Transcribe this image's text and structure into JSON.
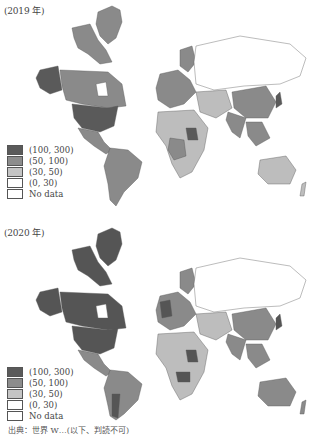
{
  "figure": {
    "panels": [
      {
        "label": "(2019 年)",
        "year": "2019",
        "region_shades": {
          "north_america_arctic": "#8a8a8a",
          "alaska": "#5a5a5a",
          "canada": "#8a8a8a",
          "usa": "#5a5a5a",
          "mexico": "#8a8a8a",
          "south_america": "#8a8a8a",
          "greenland": "#8a8a8a",
          "russia": "#ffffff",
          "europe": "#8a8a8a",
          "china": "#8a8a8a",
          "india": "#8a8a8a",
          "africa": "#bdbdbd",
          "australia": "#bdbdbd",
          "middle_east": "#bdbdbd"
        }
      },
      {
        "label": "(2020 年)",
        "year": "2020",
        "region_shades": {
          "north_america_arctic": "#555555",
          "alaska": "#555555",
          "canada": "#555555",
          "usa": "#555555",
          "mexico": "#8a8a8a",
          "south_america": "#8a8a8a",
          "greenland": "#555555",
          "russia": "#ffffff",
          "europe": "#8a8a8a",
          "china": "#8a8a8a",
          "india": "#8a8a8a",
          "africa": "#bdbdbd",
          "australia": "#8a8a8a",
          "middle_east": "#bdbdbd"
        }
      }
    ],
    "legend": [
      {
        "label": "(100, 300)",
        "color": "#5a5a5a"
      },
      {
        "label": "(50, 100)",
        "color": "#8c8c8c"
      },
      {
        "label": "(30, 50)",
        "color": "#c4c4c4"
      },
      {
        "label": "(0, 30)",
        "color": "#ffffff"
      },
      {
        "label": "No data",
        "color": "#ffffff"
      }
    ],
    "source_line": "出典：世界 W…(以下、判読不可)"
  }
}
